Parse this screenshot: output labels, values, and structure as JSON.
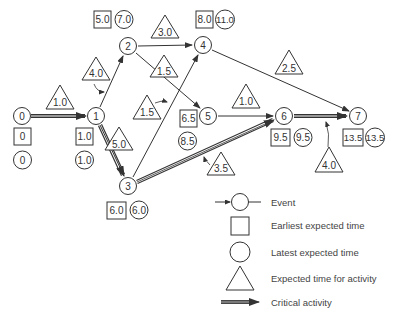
{
  "diagram": {
    "type": "PERT network",
    "nodes": [
      {
        "id": "0",
        "x": 22,
        "y": 116,
        "earliest": "0",
        "latest": "0",
        "times_pos": "below"
      },
      {
        "id": "1",
        "x": 96,
        "y": 116,
        "earliest": "1.0",
        "latest": "1.0",
        "times_pos": "below"
      },
      {
        "id": "2",
        "x": 128,
        "y": 46,
        "earliest": "5.0",
        "latest": "7.0",
        "times_pos": "above"
      },
      {
        "id": "3",
        "x": 128,
        "y": 186,
        "earliest": "6.0",
        "latest": "6.0",
        "times_pos": "below-row"
      },
      {
        "id": "4",
        "x": 203,
        "y": 45,
        "earliest": "8.0",
        "latest": "11.0",
        "times_pos": "above"
      },
      {
        "id": "5",
        "x": 208,
        "y": 116,
        "earliest": "6.5",
        "latest": "8.5",
        "times_pos": "left"
      },
      {
        "id": "6",
        "x": 284,
        "y": 116,
        "earliest": "9.5",
        "latest": "9.5",
        "times_pos": "below-row"
      },
      {
        "id": "7",
        "x": 358,
        "y": 116,
        "earliest": "13.5",
        "latest": "13.5",
        "times_pos": "below-row"
      }
    ],
    "activities": [
      {
        "from": "0",
        "to": "1",
        "time": "1.0",
        "critical": true
      },
      {
        "from": "1",
        "to": "2",
        "time": "4.0",
        "critical": false
      },
      {
        "from": "1",
        "to": "3",
        "time": "5.0",
        "critical": true
      },
      {
        "from": "2",
        "to": "4",
        "time": "3.0",
        "critical": false
      },
      {
        "from": "2",
        "to": "5",
        "time": "1.5",
        "critical": false
      },
      {
        "from": "3",
        "to": "4",
        "time": "1.5",
        "critical": false
      },
      {
        "from": "3",
        "to": "6",
        "time": "3.5",
        "critical": true
      },
      {
        "from": "5",
        "to": "6",
        "time": "1.0",
        "critical": false
      },
      {
        "from": "4",
        "to": "7",
        "time": "2.5",
        "critical": false
      },
      {
        "from": "6",
        "to": "7",
        "time": "4.0",
        "critical": true
      }
    ]
  },
  "legend": {
    "event": "Event",
    "earliest": "Earliest expected time",
    "latest": "Latest expected time",
    "activity_time": "Expected time for activity",
    "critical": "Critical activity"
  },
  "labels": {
    "n0": "0",
    "n1": "1",
    "n2": "2",
    "n3": "3",
    "n4": "4",
    "n5": "5",
    "n6": "6",
    "n7": "7",
    "e0": "0",
    "l0": "0",
    "e1": "1.0",
    "l1": "1.0",
    "e2": "5.0",
    "l2": "7.0",
    "e3": "6.0",
    "l3": "6.0",
    "e4": "8.0",
    "l4": "11.0",
    "e5": "6.5",
    "l5": "8.5",
    "e6": "9.5",
    "l6": "9.5",
    "e7": "13.5",
    "l7": "13.5",
    "a01": "1.0",
    "a12": "4.0",
    "a13": "5.0",
    "a24": "3.0",
    "a25": "1.5",
    "a34": "1.5",
    "a36": "3.5",
    "a56": "1.0",
    "a47": "2.5",
    "a67": "4.0"
  }
}
